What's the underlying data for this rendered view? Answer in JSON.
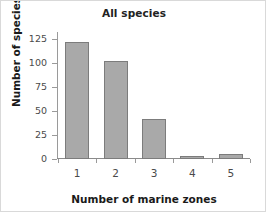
{
  "chart_data": {
    "type": "bar",
    "title": "All species",
    "xlabel": "Number of marine zones",
    "ylabel": "Number of species",
    "categories": [
      "1",
      "2",
      "3",
      "4",
      "5"
    ],
    "values": [
      122,
      102,
      42,
      3,
      5
    ],
    "ylim": [
      0,
      131
    ],
    "yticks": [
      0,
      25,
      50,
      75,
      100,
      125
    ],
    "ytick_labels": [
      "0",
      "25",
      "50",
      "75",
      "100",
      "125"
    ],
    "grid": false,
    "legend": null,
    "bar_color": "#a9a9a9",
    "bar_edge_color": "#7c7c7c",
    "axis_color": "#9a9a9a"
  }
}
